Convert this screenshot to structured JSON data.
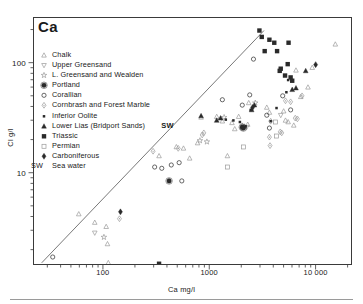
{
  "chart": {
    "title": "Ca",
    "xlabel": "Ca mg/l",
    "ylabel": "Cl g/l",
    "sw_annotation": "SW",
    "sw_key": "SW",
    "sw_key_label": "Sea water"
  },
  "chart_data": {
    "type": "scatter",
    "title": "Ca",
    "xlabel": "Ca mg/l",
    "ylabel": "Cl g/l",
    "xscale": "log",
    "yscale": "log",
    "xlim": [
      22,
      22000
    ],
    "ylim": [
      1.45,
      260
    ],
    "grid": false,
    "legend_position": "upper-left-inside",
    "xticks": [
      100,
      1000,
      10000
    ],
    "xtick_labels": [
      "100",
      "1000",
      "10 000"
    ],
    "yticks": [
      10,
      100
    ],
    "ytick_labels": [
      "10",
      "100"
    ],
    "xminor_ticks": [
      30,
      40,
      50,
      60,
      70,
      80,
      90,
      200,
      300,
      400,
      500,
      600,
      700,
      800,
      900,
      2000,
      3000,
      4000,
      5000,
      6000,
      7000,
      8000,
      9000,
      20000
    ],
    "yminor_ticks": [
      2,
      3,
      4,
      5,
      6,
      7,
      8,
      9,
      20,
      30,
      40,
      50,
      60,
      70,
      80,
      90,
      200
    ],
    "trendline": {
      "label": "sea-water dilution line",
      "x": [
        26,
        3200
      ],
      "y": [
        1.55,
        200
      ]
    },
    "annotations": [
      {
        "text": "SW",
        "x": 430,
        "y": 22.5
      }
    ],
    "series": [
      {
        "name": "Chalk",
        "marker": "triangle-up-open",
        "color": "#9a9a9a",
        "points": [
          [
            58,
            4.3
          ],
          [
            82,
            3.6
          ],
          [
            105,
            3.3
          ],
          [
            108,
            2.3
          ],
          [
            110,
            1.55
          ],
          [
            330,
            14.5
          ],
          [
            480,
            17.5
          ],
          [
            560,
            17.0
          ],
          [
            640,
            13.8
          ],
          [
            760,
            19.0
          ],
          [
            820,
            32.5
          ],
          [
            1150,
            33.0
          ],
          [
            1300,
            30.0
          ],
          [
            1450,
            14.5
          ],
          [
            1600,
            29.0
          ],
          [
            1700,
            25.5
          ],
          [
            1850,
            33.0
          ],
          [
            2000,
            27.5
          ],
          [
            2100,
            27.0
          ],
          [
            2250,
            28.0
          ],
          [
            2300,
            44.0
          ],
          [
            3400,
            40.0
          ],
          [
            3600,
            36.0
          ],
          [
            4900,
            37.0
          ],
          [
            5100,
            30.5
          ],
          [
            5400,
            29.5
          ],
          [
            6100,
            27.5
          ],
          [
            6400,
            87.0
          ],
          [
            7100,
            50.0
          ],
          [
            8300,
            61.0
          ],
          [
            9100,
            92.0
          ],
          [
            15000,
            150.0
          ]
        ]
      },
      {
        "name": "Upper Greensand",
        "marker": "triangle-down-open",
        "color": "#9a9a9a",
        "points": [
          [
            82,
            2.9
          ],
          [
            2200,
            26.5
          ],
          [
            4600,
            34.0
          ]
        ]
      },
      {
        "name": "L. Greensand and Wealden",
        "marker": "star-open",
        "color": "#9a9a9a",
        "points": [
          [
            100,
            2.65
          ],
          [
            800,
            20.0
          ],
          [
            930,
            19.5
          ],
          [
            1350,
            32.5
          ],
          [
            2650,
            44.0
          ]
        ]
      },
      {
        "name": "Portland",
        "marker": "circle-dot-filled",
        "color": "#2a2a2a",
        "points": [
          [
            410,
            8.6
          ],
          [
            2000,
            26.5
          ],
          [
            2050,
            26.0
          ]
        ]
      },
      {
        "name": "Corallian",
        "marker": "circle-open",
        "color": "#2a2a2a",
        "points": [
          [
            33,
            1.75
          ],
          [
            300,
            11.5
          ],
          [
            350,
            11.2
          ],
          [
            430,
            12.0
          ],
          [
            510,
            12.6
          ],
          [
            540,
            8.6
          ],
          [
            1300,
            47.0
          ],
          [
            2000,
            42.0
          ],
          [
            2350,
            52.0
          ],
          [
            2550,
            110.0
          ],
          [
            3400,
            34.0
          ],
          [
            3600,
            26.0
          ],
          [
            4800,
            51.0
          ],
          [
            5700,
            38.0
          ]
        ]
      },
      {
        "name": "Cornbrash and Forest Marble",
        "marker": "diamond-dot-open",
        "color": "#9a9a9a",
        "points": [
          [
            140,
            3.9
          ],
          [
            290,
            16.0
          ],
          [
            500,
            17.0
          ],
          [
            840,
            22.5
          ],
          [
            870,
            23.5
          ],
          [
            3600,
            21.5
          ],
          [
            3650,
            18.0
          ],
          [
            3700,
            30.0
          ],
          [
            4550,
            24.0
          ],
          [
            4700,
            23.5
          ],
          [
            5100,
            46.0
          ],
          [
            5700,
            45.0
          ],
          [
            6300,
            32.0
          ],
          [
            6600,
            31.5
          ],
          [
            7300,
            51.0
          ]
        ]
      },
      {
        "name": "Inferior Oolite",
        "marker": "square-small-filled",
        "color": "#2a2a2a",
        "points": [
          [
            1400,
            31.0
          ],
          [
            1650,
            30.5
          ],
          [
            1900,
            29.5
          ],
          [
            2150,
            27.0
          ],
          [
            2400,
            38.0
          ],
          [
            3700,
            30.0
          ],
          [
            4200,
            39.5
          ],
          [
            5200,
            55.0
          ],
          [
            5400,
            71.0
          ]
        ]
      },
      {
        "name": "Lower Lias (Bridport Sands)",
        "marker": "triangle-up-filled",
        "color": "#2a2a2a",
        "points": [
          [
            820,
            33.5
          ],
          [
            1150,
            30.5
          ],
          [
            1250,
            32.0
          ],
          [
            2450,
            38.0
          ],
          [
            2600,
            42.0
          ],
          [
            5900,
            58.0
          ],
          [
            6400,
            60.0
          ],
          [
            7900,
            86.0
          ]
        ]
      },
      {
        "name": "Triassic",
        "marker": "square-filled",
        "color": "#2a2a2a",
        "points": [
          [
            330,
            1.52
          ],
          [
            2900,
            200.0
          ],
          [
            3050,
            175.0
          ],
          [
            3250,
            130.0
          ],
          [
            3600,
            165.0
          ],
          [
            4000,
            155.0
          ],
          [
            4250,
            130.0
          ],
          [
            4500,
            86.0
          ],
          [
            4600,
            90.0
          ],
          [
            5050,
            78.0
          ],
          [
            5350,
            99.0
          ],
          [
            5450,
            155.0
          ],
          [
            5700,
            75.0
          ],
          [
            5900,
            70.0
          ]
        ]
      },
      {
        "name": "Permian",
        "marker": "square-open",
        "color": "#9a9a9a",
        "points": [
          [
            1450,
            11.5
          ],
          [
            2050,
            17.5
          ],
          [
            4100,
            29.5
          ],
          [
            4200,
            22.0
          ]
        ]
      },
      {
        "name": "Carboniferous",
        "marker": "diamond-filled",
        "color": "#2a2a2a",
        "points": [
          [
            143,
            4.5
          ],
          [
            2500,
            40.0
          ],
          [
            9800,
            98.0
          ]
        ]
      }
    ]
  },
  "legend": {
    "items": [
      {
        "label": "Chalk",
        "marker": "triangle-up-open",
        "color": "#9a9a9a"
      },
      {
        "label": "Upper Greensand",
        "marker": "triangle-down-open",
        "color": "#9a9a9a"
      },
      {
        "label": "L. Greensand and Wealden",
        "marker": "star-open",
        "color": "#9a9a9a"
      },
      {
        "label": "Portland",
        "marker": "circle-dot-filled",
        "color": "#2a2a2a"
      },
      {
        "label": "Corallian",
        "marker": "circle-open",
        "color": "#2a2a2a"
      },
      {
        "label": "Cornbrash and Forest Marble",
        "marker": "diamond-dot-open",
        "color": "#9a9a9a"
      },
      {
        "label": "Inferior Oolite",
        "marker": "square-small-filled",
        "color": "#2a2a2a"
      },
      {
        "label": "Lower Lias (Bridport Sands)",
        "marker": "triangle-up-filled",
        "color": "#2a2a2a"
      },
      {
        "label": "Triassic",
        "marker": "square-filled",
        "color": "#2a2a2a"
      },
      {
        "label": "Permian",
        "marker": "square-open",
        "color": "#9a9a9a"
      },
      {
        "label": "Carboniferous",
        "marker": "diamond-filled",
        "color": "#2a2a2a"
      }
    ]
  }
}
